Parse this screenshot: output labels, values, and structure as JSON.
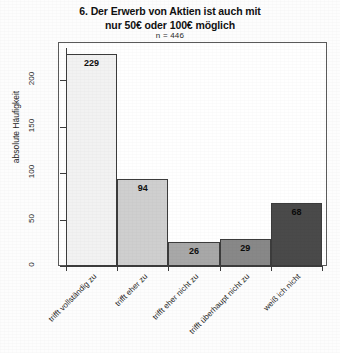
{
  "chart_data": {
    "type": "bar",
    "title": "6. Der Erwerb von Aktien ist auch mit nur 50€ oder 100€ möglich",
    "title_lines": [
      "6. Der Erwerb von Aktien ist auch mit",
      "nur 50€ oder 100€ möglich"
    ],
    "subtitle": "n = 446",
    "xlabel": "",
    "ylabel": "absolute Häufigkeit",
    "ylim": [
      0,
      235
    ],
    "yticks": [
      0,
      50,
      100,
      150,
      200
    ],
    "ytick_labels": [
      "0",
      "50",
      "100",
      "150",
      "200"
    ],
    "grid": false,
    "legend": false,
    "categories": [
      "trifft vollständig zu",
      "trifft eher zu",
      "trifft eher nicht zu",
      "trifft überhaupt nicht zu",
      "weiß ich nicht"
    ],
    "values": [
      229,
      94,
      26,
      29,
      68
    ],
    "value_labels": [
      "229",
      "94",
      "26",
      "29",
      "68"
    ],
    "bar_colors": [
      "#f2f2f2",
      "#cfcfcf",
      "#a8a8a8",
      "#888888",
      "#4a4a4a"
    ],
    "bar_border_color": "#3c3c3c",
    "axis_color": "#3c3c3c",
    "frame_color": "#5a5a5a",
    "background": "#ffffff"
  }
}
